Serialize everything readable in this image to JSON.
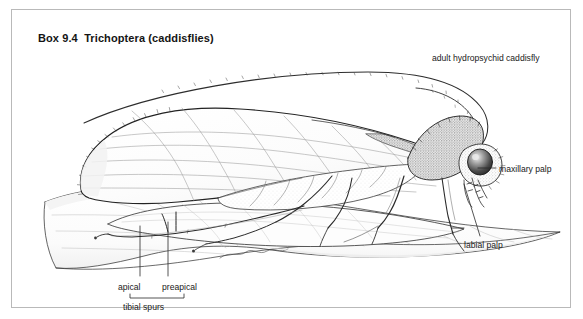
{
  "figure": {
    "title": "Box 9.4  Trichoptera (caddisflies)",
    "border_color": "#b9b9b9",
    "background_color": "#ffffff",
    "ink_color": "#1a1a1a"
  },
  "labels": {
    "adult": "adult hydropsychid caddisfly",
    "maxillary_palp": "maxillary palp",
    "labial_palp": "labial palp",
    "apical": "apical",
    "preapical": "preapical",
    "tibial_spurs": "tibial spurs"
  },
  "illustration": {
    "subject": "adult hydropsychid caddisfly resting on a leaf",
    "parts": [
      "long filiform antennae",
      "forewing with longitudinal venation",
      "hindwing",
      "compound eye",
      "hairy thorax",
      "three pairs of legs",
      "maxillary palp",
      "labial palp",
      "apical tibial spur",
      "preapical tibial spur",
      "leaf substrate with midrib and veins"
    ]
  }
}
